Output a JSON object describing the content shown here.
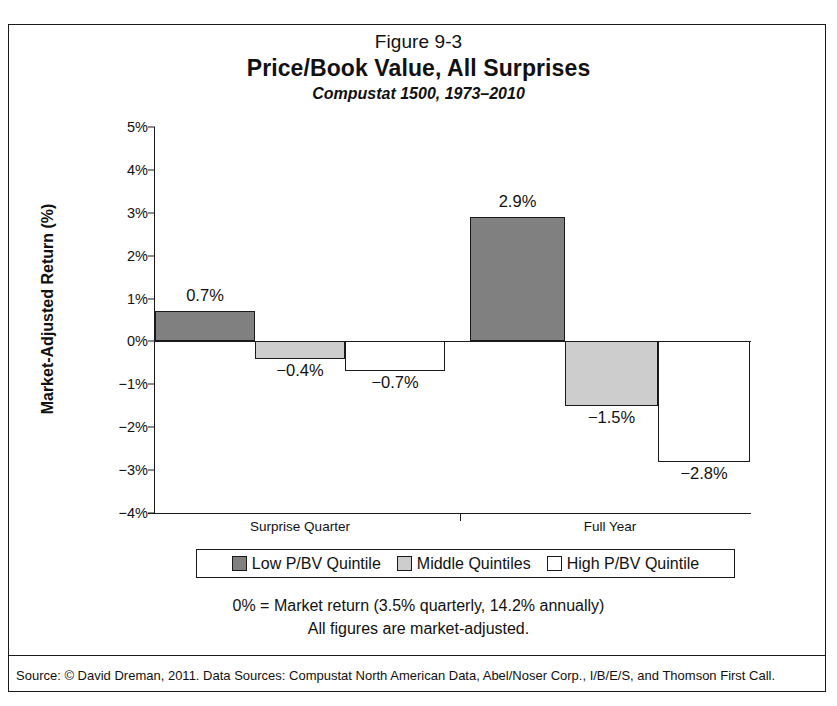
{
  "figure": {
    "number": "Figure 9-3",
    "title": "Price/Book Value, All Surprises",
    "subtitle": "Compustat 1500, 1973–2010"
  },
  "notes": {
    "line1": "0% = Market return (3.5% quarterly, 14.2% annually)",
    "line2": "All figures are market-adjusted."
  },
  "source": "Source: © David Dreman, 2011. Data Sources: Compustat North American Data, Abel/Noser Corp., I/B/E/S, and Thomson First Call.",
  "colors": {
    "low_quintile": "#808080",
    "middle_quintiles": "#cdcdcd",
    "high_quintile": "#ffffff",
    "line": "#1a1a1a"
  },
  "chart_data": {
    "type": "bar",
    "title": "Price/Book Value, All Surprises",
    "subtitle": "Compustat 1500, 1973–2010",
    "xlabel": "",
    "ylabel": "Market-Adjusted Return (%)",
    "ylim": [
      -4,
      5
    ],
    "ytick_values": [
      5,
      4,
      3,
      2,
      1,
      0,
      -1,
      -2,
      -3,
      -4
    ],
    "ytick_labels": [
      "5%",
      "4%",
      "3%",
      "2%",
      "1%",
      "0%",
      "−1%",
      "−2%",
      "−3%",
      "−4%"
    ],
    "grid": false,
    "legend_position": "bottom",
    "categories": [
      "Surprise Quarter",
      "Full Year"
    ],
    "series": [
      {
        "name": "Low P/BV Quintile",
        "values": [
          0.7,
          2.9
        ],
        "labels": [
          "0.7%",
          "2.9%"
        ],
        "color": "#808080"
      },
      {
        "name": "Middle Quintiles",
        "values": [
          -0.4,
          -1.5
        ],
        "labels": [
          "−0.4%",
          "−1.5%"
        ],
        "color": "#cdcdcd"
      },
      {
        "name": "High P/BV Quintile",
        "values": [
          -0.7,
          -2.8
        ],
        "labels": [
          "−0.7%",
          "−2.8%"
        ],
        "color": "#ffffff"
      }
    ],
    "annotations": [
      "0% = Market return (3.5% quarterly, 14.2% annually)",
      "All figures are market-adjusted."
    ]
  }
}
